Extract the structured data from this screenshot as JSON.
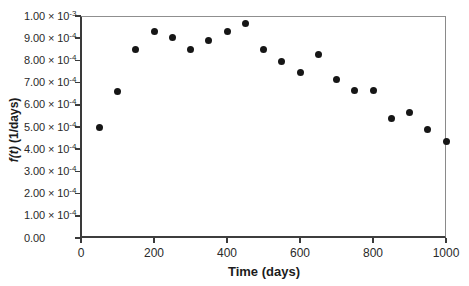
{
  "chart_data": {
    "type": "scatter",
    "title": "",
    "xlabel": "Time (days)",
    "ylabel": "f(t) (1/days)",
    "ylabel_italic": "f(t)",
    "ylabel_rest": " (1/days)",
    "xlim": [
      0,
      1000
    ],
    "ylim": [
      0,
      0.001
    ],
    "grid": "off",
    "legend": "none",
    "marker": {
      "shape": "filled-circle",
      "color": "#161616",
      "diameter_px": 7
    },
    "axis_colors": {
      "axis": "#3a3a3a",
      "frame": "#8f8f8f",
      "text": "#262626"
    },
    "x_ticks": [
      {
        "value": 0,
        "label": "0"
      },
      {
        "value": 200,
        "label": "200"
      },
      {
        "value": 400,
        "label": "400"
      },
      {
        "value": 600,
        "label": "600"
      },
      {
        "value": 800,
        "label": "800"
      },
      {
        "value": 1000,
        "label": "1000"
      }
    ],
    "y_ticks": [
      {
        "value": 0.001,
        "base": "1.00 × 10",
        "sup": "-3"
      },
      {
        "value": 0.0009,
        "base": "9.00 × 10",
        "sup": "-4"
      },
      {
        "value": 0.0008,
        "base": "8.00 × 10",
        "sup": "-4"
      },
      {
        "value": 0.0007,
        "base": "7.00 × 10",
        "sup": "-4"
      },
      {
        "value": 0.0006,
        "base": "6.00 × 10",
        "sup": "-4"
      },
      {
        "value": 0.0005,
        "base": "5.00 × 10",
        "sup": "-4"
      },
      {
        "value": 0.0004,
        "base": "4.00 × 10",
        "sup": "-4"
      },
      {
        "value": 0.0003,
        "base": "3.00 × 10",
        "sup": "-4"
      },
      {
        "value": 0.0002,
        "base": "2.00 × 10",
        "sup": "-4"
      },
      {
        "value": 0.0001,
        "base": "1.00 × 10",
        "sup": "-4"
      },
      {
        "value": 0,
        "base": "0.00",
        "sup": ""
      }
    ],
    "points": [
      [
        50,
        0.0005
      ],
      [
        100,
        0.00066
      ],
      [
        150,
        0.00085
      ],
      [
        200,
        0.00093
      ],
      [
        250,
        0.000905
      ],
      [
        300,
        0.00085
      ],
      [
        350,
        0.00089
      ],
      [
        400,
        0.00093
      ],
      [
        450,
        0.000965
      ],
      [
        500,
        0.00085
      ],
      [
        550,
        0.000795
      ],
      [
        600,
        0.000745
      ],
      [
        650,
        0.000825
      ],
      [
        700,
        0.000715
      ],
      [
        750,
        0.000665
      ],
      [
        800,
        0.000665
      ],
      [
        850,
        0.00054
      ],
      [
        900,
        0.000565
      ],
      [
        950,
        0.00049
      ],
      [
        1000,
        0.000435
      ]
    ]
  }
}
